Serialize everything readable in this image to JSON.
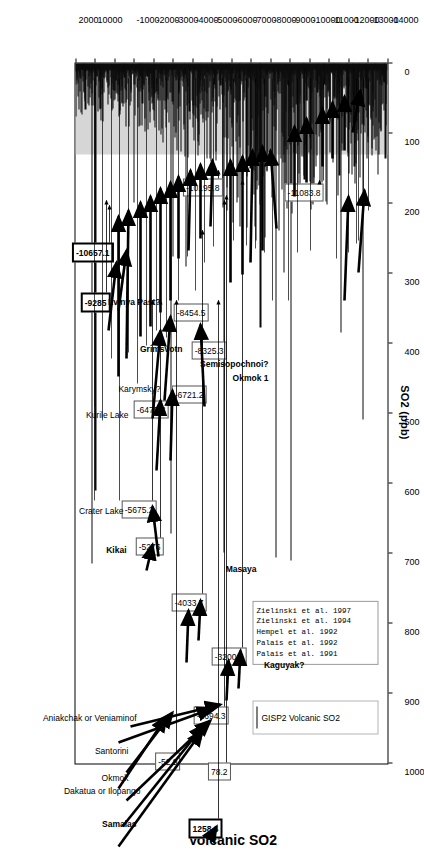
{
  "chart_data": {
    "type": "bar",
    "title": "Volcanic SO2",
    "xlabel": "SO2 (ppb)",
    "ylabel": "",
    "xlim": [
      0,
      1000
    ],
    "ylim": [
      -14000,
      2000
    ],
    "xticks": [
      "0",
      "100",
      "200",
      "300",
      "400",
      "500",
      "600",
      "700",
      "800",
      "900",
      "1000"
    ],
    "yticks": [
      "-14000",
      "-13000",
      "-12000",
      "-11000",
      "-10000",
      "-9000",
      "-8000",
      "-7000",
      "-6000",
      "-5000",
      "-4000",
      "-3000",
      "-2000",
      "-1000",
      "0",
      "1000",
      "2000"
    ],
    "grid": false,
    "legend_position": "top-right",
    "series": [
      {
        "name": "GISP2 Volcanic SO2",
        "color": "#000000"
      }
    ],
    "background_band": {
      "from": 0,
      "to": 130,
      "color": "#d6d6d6"
    },
    "annotations": [
      {
        "value": "-11083.8",
        "bold": false
      },
      {
        "value": "-10657.1",
        "bold": true
      },
      {
        "value": "-10195.8",
        "bold": false
      },
      {
        "value": "-9285",
        "bold": true
      },
      {
        "value": "-8454.5",
        "bold": false
      },
      {
        "value": "-8325.3",
        "bold": false
      },
      {
        "value": "-6721.2",
        "bold": false
      },
      {
        "value": "-6475.3",
        "bold": false
      },
      {
        "value": "-5675.2",
        "bold": false
      },
      {
        "value": "-5276",
        "bold": false
      },
      {
        "value": "-4033.7",
        "bold": false
      },
      {
        "value": "-3200.5",
        "bold": false
      },
      {
        "value": "-1694.3",
        "bold": false
      },
      {
        "value": "-52.9",
        "bold": false
      },
      {
        "value": "78.2",
        "bold": false
      },
      {
        "value": "1258.6",
        "bold": true
      }
    ],
    "volcano_labels": [
      {
        "name": "Lvinya Past?",
        "bold": true
      },
      {
        "name": "Grimsvotn",
        "bold": true
      },
      {
        "name": "Semisopochnoi?",
        "bold": true
      },
      {
        "name": "Okmok 1",
        "bold": true
      },
      {
        "name": "Karymsky?",
        "bold": false
      },
      {
        "name": "Kurile Lake",
        "bold": false
      },
      {
        "name": "Crater Lake",
        "bold": false
      },
      {
        "name": "Kikai",
        "bold": true
      },
      {
        "name": "Masaya",
        "bold": true
      },
      {
        "name": "Kaguyak?",
        "bold": true
      },
      {
        "name": "Aniakchak or Veniaminof",
        "bold": false
      },
      {
        "name": "Santorini",
        "bold": false
      },
      {
        "name": "Okmok",
        "bold": false
      },
      {
        "name": "Dakatua or Ilopango",
        "bold": false
      },
      {
        "name": "Samalas",
        "bold": true
      }
    ]
  },
  "chart": {
    "title": "Volcanic SO2",
    "x_axis_title": "SO2 (ppb)",
    "x_ticks": [
      "0",
      "100",
      "200",
      "300",
      "400",
      "500",
      "600",
      "700",
      "800",
      "900",
      "1000"
    ],
    "y_ticks": [
      "-14000",
      "-13000",
      "-12000",
      "-11000",
      "-10000",
      "-9000",
      "-8000",
      "-7000",
      "-6000",
      "-5000",
      "-4000",
      "-3000",
      "-2000",
      "-1000",
      "0",
      "1000",
      "2000"
    ]
  },
  "legend": {
    "series_label": "GISP2 Volcanic SO2",
    "references": [
      "Zielinski et al. 1997",
      "Zielinski et al. 1994",
      "Hempel et al. 1992",
      "Palais et al. 1992",
      "Palais et al. 1991"
    ]
  },
  "callouts": {
    "c1": "-11083.8",
    "c2": "-10657.1",
    "c3": "-10195.8",
    "c4": "-9285",
    "c5": "-8454.5",
    "c6": "-8325.3",
    "c7": "-6721.2",
    "c8": "-6475.3",
    "c9": "-5675.2",
    "c10": "-5276",
    "c11": "-4033.7",
    "c12": "-3200.5",
    "c13": "-1694.3",
    "c14": "-52.9",
    "c15": "78.2",
    "c16": "1258.6"
  },
  "volcanoes": {
    "v1": "Lvinya Past?",
    "v2": "Grimsvotn",
    "v3": "Semisopochnoi?",
    "v4": "Okmok 1",
    "v5": "Karymsky?",
    "v6": "Kurile Lake",
    "v7": "Crater Lake",
    "v8": "Kikai",
    "v9": "Masaya",
    "v10": "Kaguyak?",
    "v11": "Aniakchak or Veniaminof",
    "v12": "Santorini",
    "v13": "Okmok",
    "v14": "Dakatua or Ilopango",
    "v15": "Samalas"
  }
}
